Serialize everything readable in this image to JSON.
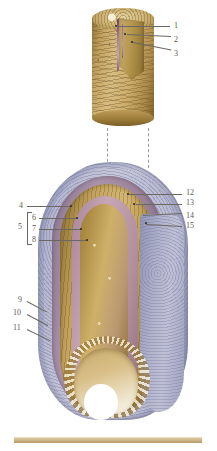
{
  "plate": {
    "title": "Bone structure plate",
    "background_color": "#ffffff",
    "label_color": "#5d5a55",
    "leader_color": "#6b6862",
    "width": 217,
    "height": 451
  },
  "figures": [
    {
      "id": "osteon-cylinder",
      "name": "Cylindrical bone segment with cut-away wedge",
      "description": "Top figure: cylindrical shaft of compact bone, tan/gold, with a wedge removed exposing a central canal",
      "colors": {
        "cortex": "#cdad6b",
        "canal": "#a87ba4",
        "cut_face": "#b6984f"
      }
    },
    {
      "id": "epiphysis-section",
      "name": "Longitudinal section of bone end",
      "description": "Lower figure: longitudinal section through the end of a long bone showing concentric layers and trabecular marrow cavity",
      "colors": {
        "periosteum": "#b4b6cf",
        "mauve_layer": "#ab93ad",
        "cortical_gold": "#d3b673",
        "inner_pink": "#c6a6b6",
        "marrow_cavity": "#efe6cf",
        "shaft": "#b0b2cc"
      }
    }
  ],
  "labels": [
    {
      "n": "1",
      "x": 174,
      "y": 22,
      "side": "right",
      "target_x": 116,
      "target_y": 26
    },
    {
      "n": "2",
      "x": 174,
      "y": 36,
      "side": "right",
      "target_x": 126,
      "target_y": 34
    },
    {
      "n": "3",
      "x": 174,
      "y": 50,
      "side": "right",
      "target_x": 133,
      "target_y": 42
    },
    {
      "n": "4",
      "x": 19,
      "y": 203,
      "side": "left",
      "target_x": 70,
      "target_y": 206
    },
    {
      "n": "5",
      "x": 19,
      "y": 226,
      "side": "left",
      "target_x": 28,
      "target_y": 226,
      "bracket": true
    },
    {
      "n": "6",
      "x": 31,
      "y": 216,
      "side": "left",
      "target_x": 76,
      "target_y": 218
    },
    {
      "n": "7",
      "x": 31,
      "y": 227,
      "side": "left",
      "target_x": 80,
      "target_y": 229
    },
    {
      "n": "8",
      "x": 31,
      "y": 238,
      "side": "left",
      "target_x": 86,
      "target_y": 240
    },
    {
      "n": "9",
      "x": 17,
      "y": 299,
      "side": "left",
      "target_x": 46,
      "target_y": 312
    },
    {
      "n": "10",
      "x": 13,
      "y": 312,
      "side": "left",
      "target_x": 48,
      "target_y": 326
    },
    {
      "n": "11",
      "x": 13,
      "y": 327,
      "side": "left",
      "target_x": 50,
      "target_y": 341
    },
    {
      "n": "12",
      "x": 186,
      "y": 192,
      "side": "right",
      "target_x": 129,
      "target_y": 194
    },
    {
      "n": "13",
      "x": 186,
      "y": 202,
      "side": "right",
      "target_x": 134,
      "target_y": 204
    },
    {
      "n": "14",
      "x": 186,
      "y": 217,
      "side": "right",
      "target_x": 143,
      "target_y": 213
    },
    {
      "n": "15",
      "x": 186,
      "y": 227,
      "side": "right",
      "target_x": 146,
      "target_y": 222
    }
  ],
  "bracket": {
    "label": "5",
    "top": 212,
    "bottom": 243,
    "x": 27,
    "width": 4
  },
  "connectors": [
    {
      "name": "dashed-connector-left",
      "x": 107,
      "top": 128,
      "bottom": 172
    },
    {
      "name": "dashed-connector-right",
      "x": 148,
      "top": 128,
      "bottom": 168
    }
  ],
  "scale_bar": {
    "name": "scale-bar",
    "color": "#c9b083",
    "x": 14,
    "y": 437,
    "width": 188,
    "height": 5
  }
}
